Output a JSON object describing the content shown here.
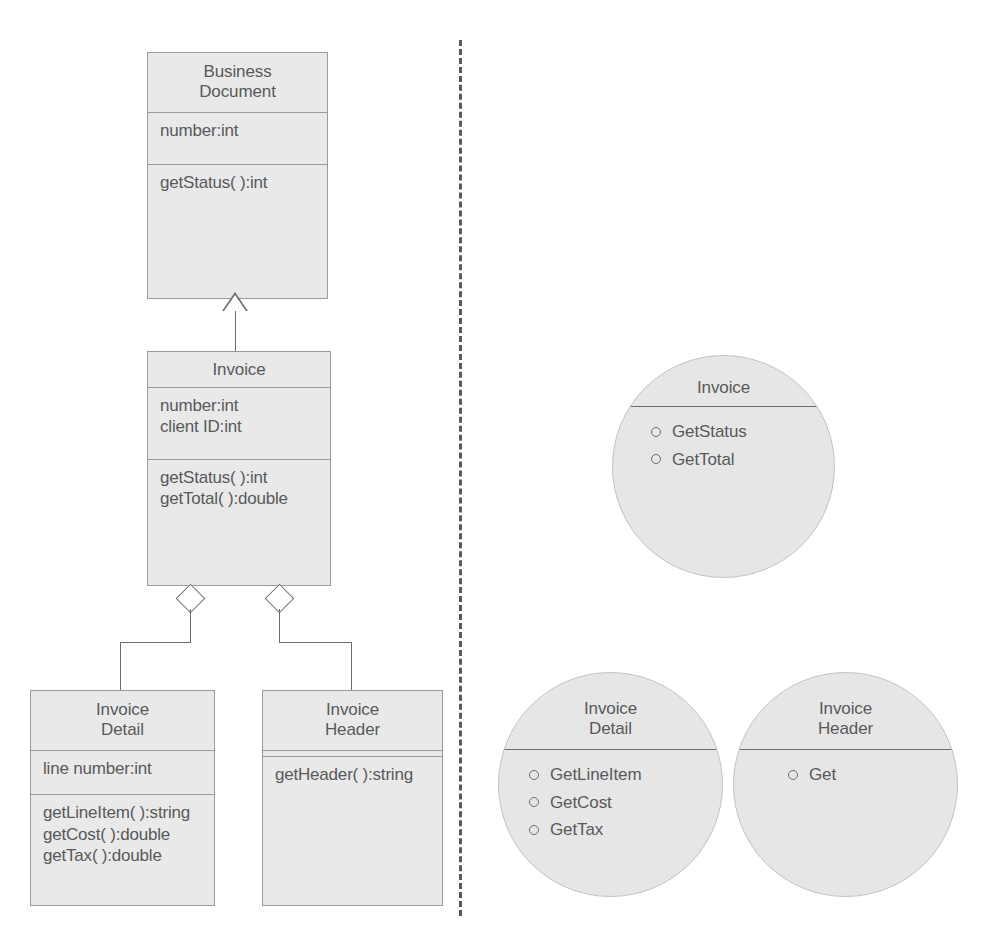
{
  "diagram": {
    "colors": {
      "box_fill": "#e9e9e9",
      "box_border": "#9a9a9a",
      "circle_fill": "#e6e6e6",
      "circle_border": "#c2c2c2",
      "line": "#6d6e71",
      "text": "#58595b",
      "background": "#ffffff"
    },
    "divider": {
      "style": "dashed",
      "orientation": "vertical"
    }
  },
  "classes": [
    {
      "id": "business-document",
      "title_lines": [
        "Business",
        "Document"
      ],
      "attributes": [
        "number:int"
      ],
      "operations": [
        "getStatus( ):int"
      ]
    },
    {
      "id": "invoice",
      "title_lines": [
        "Invoice"
      ],
      "attributes": [
        "number:int",
        "client ID:int"
      ],
      "operations": [
        "getStatus( ):int",
        "getTotal( ):double"
      ]
    },
    {
      "id": "invoice-detail",
      "title_lines": [
        "Invoice",
        "Detail"
      ],
      "attributes": [
        "line number:int"
      ],
      "operations": [
        "getLineItem( ):string",
        "getCost( ):double",
        "getTax( ):double"
      ]
    },
    {
      "id": "invoice-header",
      "title_lines": [
        "Invoice",
        "Header"
      ],
      "attributes": [],
      "operations": [
        "getHeader( ):string"
      ]
    }
  ],
  "relationships": [
    {
      "type": "generalization",
      "from": "invoice",
      "to": "business-document",
      "marker": "hollow-triangle"
    },
    {
      "type": "aggregation",
      "from": "invoice",
      "to": "invoice-detail",
      "marker": "hollow-diamond"
    },
    {
      "type": "aggregation",
      "from": "invoice",
      "to": "invoice-header",
      "marker": "hollow-diamond"
    }
  ],
  "circles": [
    {
      "id": "circle-invoice",
      "title_lines": [
        "Invoice"
      ],
      "responsibilities": [
        "GetStatus",
        "GetTotal"
      ]
    },
    {
      "id": "circle-invoice-detail",
      "title_lines": [
        "Invoice",
        "Detail"
      ],
      "responsibilities": [
        "GetLineItem",
        "GetCost",
        "GetTax"
      ]
    },
    {
      "id": "circle-invoice-header",
      "title_lines": [
        "Invoice",
        "Header"
      ],
      "responsibilities": [
        "Get"
      ]
    }
  ]
}
